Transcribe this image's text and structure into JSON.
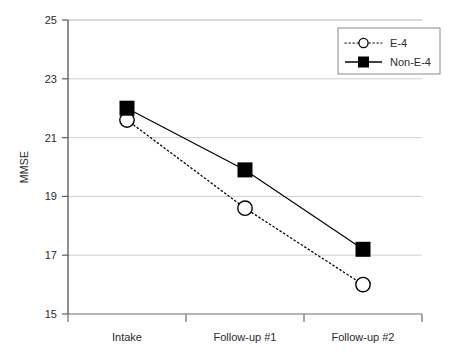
{
  "chart_data": {
    "type": "line",
    "title": "",
    "subtitle": "",
    "xlabel": "",
    "ylabel": "MMSE",
    "categories": [
      "Intake",
      "Follow-up #1",
      "Follow-up #2"
    ],
    "ylim": [
      15,
      25
    ],
    "yticks": [
      15,
      17,
      19,
      21,
      23,
      25
    ],
    "ytick_labels": [
      "15",
      "17",
      "19",
      "21",
      "23",
      "25"
    ],
    "grid": "horizontal",
    "legend_position": "top-right",
    "series": [
      {
        "name": "E-4",
        "values": [
          21.6,
          18.6,
          16.0
        ],
        "line_style": "dotted",
        "marker": "open-circle",
        "color": "#000000"
      },
      {
        "name": "Non-E-4",
        "values": [
          22.0,
          19.9,
          17.2
        ],
        "line_style": "solid",
        "marker": "filled-square",
        "color": "#000000"
      }
    ]
  },
  "axes": {
    "y_title": "MMSE",
    "y_tick_0": "25",
    "y_tick_1": "23",
    "y_tick_2": "21",
    "y_tick_3": "19",
    "y_tick_4": "17",
    "y_tick_5": "15",
    "x_cat_0": "Intake",
    "x_cat_1": "Follow-up #1",
    "x_cat_2": "Follow-up #2"
  },
  "legend": {
    "entry_0_label": "E-4",
    "entry_1_label": "Non-E-4"
  },
  "colors": {
    "axis": "#595959",
    "gridline": "#c9c9c9",
    "series": "#000000",
    "legend_border": "#7a7a7a",
    "background": "#ffffff"
  }
}
